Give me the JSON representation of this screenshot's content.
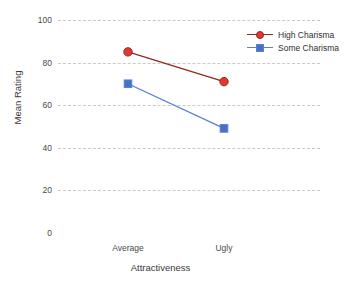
{
  "chart_data": {
    "type": "line",
    "title": "",
    "xlabel": "Attractiveness",
    "ylabel": "Mean Rating",
    "categories": [
      "Average",
      "Ugly"
    ],
    "yticks": [
      100,
      80,
      60,
      40,
      20,
      0
    ],
    "ylim": [
      0,
      100
    ],
    "grid": true,
    "legend_position": "top-right",
    "series": [
      {
        "name": "High Charisma",
        "values": [
          85,
          71
        ],
        "color": "#e8352e",
        "line_color": "#8f2a22",
        "marker": "circle"
      },
      {
        "name": "Some Charisma",
        "values": [
          70,
          49
        ],
        "color": "#4472c4",
        "line_color": "#5b7fd4",
        "marker": "square"
      }
    ]
  },
  "axes": {
    "y_title": "Mean Rating",
    "x_title": "Attractiveness",
    "y_tick_labels": [
      "100",
      "80",
      "60",
      "40",
      "20",
      "0"
    ],
    "x_tick_labels": [
      "Average",
      "Ugly"
    ]
  },
  "legend": {
    "items": [
      {
        "label": "High Charisma"
      },
      {
        "label": "Some Charisma"
      }
    ]
  },
  "colors": {
    "series_high": "#e8352e",
    "series_high_line": "#8f2a22",
    "series_some": "#4472c4",
    "series_some_line": "#5b7fd4",
    "gridline": "#c9c9c9",
    "text": "#3a3a3a",
    "background": "#ffffff"
  }
}
